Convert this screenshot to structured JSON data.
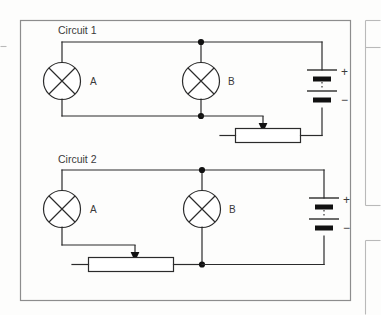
{
  "figure": {
    "title": "",
    "frame": {
      "main_panel": "main-diagram-border",
      "side_panel": "adjacent-page-panel-edge"
    },
    "circuits": [
      {
        "id": "circuit-1",
        "label": "Circuit 1",
        "topology": "parallel-lamps-with-series-rheostat-on-lamp-B-branch",
        "components": [
          {
            "type": "lamp",
            "label": "A",
            "symbol": "circle-with-cross"
          },
          {
            "type": "lamp",
            "label": "B",
            "symbol": "circle-with-cross"
          },
          {
            "type": "battery",
            "plus_label": "+",
            "minus_label": "−",
            "cells": 2
          },
          {
            "type": "rheostat",
            "symbol": "rectangle-with-arrow",
            "label": ""
          }
        ],
        "junction_dots": 2
      },
      {
        "id": "circuit-2",
        "label": "Circuit 2",
        "topology": "parallel-lamps-with-series-rheostat-on-lamp-A-branch",
        "components": [
          {
            "type": "lamp",
            "label": "A",
            "symbol": "circle-with-cross"
          },
          {
            "type": "lamp",
            "label": "B",
            "symbol": "circle-with-cross"
          },
          {
            "type": "battery",
            "plus_label": "+",
            "minus_label": "−",
            "cells": 2
          },
          {
            "type": "rheostat",
            "symbol": "rectangle-with-arrow",
            "label": ""
          }
        ],
        "junction_dots": 2
      }
    ],
    "colors": {
      "ink": "#2b2b2b",
      "node": "#111111",
      "frame": "#8d8d8d",
      "paper": "#fdfdfc"
    }
  }
}
